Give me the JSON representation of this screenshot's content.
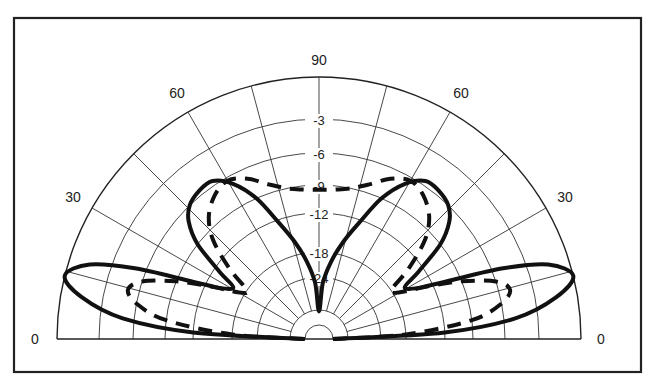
{
  "chart_data": {
    "type": "polar",
    "title": "",
    "layout": {
      "center": [
        319,
        339
      ],
      "frame": [
        14,
        18,
        641,
        372
      ],
      "grid": true,
      "half_plane": "upper"
    },
    "angle_axis": {
      "unit": "degrees elevation",
      "tick_labels": [
        {
          "text": "0",
          "angle": 0,
          "side": "right"
        },
        {
          "text": "30",
          "angle": 30,
          "side": "right"
        },
        {
          "text": "60",
          "angle": 60,
          "side": "right"
        },
        {
          "text": "90",
          "angle": 90,
          "side": "top"
        },
        {
          "text": "60",
          "angle": 120,
          "side": "left"
        },
        {
          "text": "30",
          "angle": 150,
          "side": "left"
        },
        {
          "text": "0",
          "angle": 180,
          "side": "left"
        }
      ],
      "spokes_deg": [
        15,
        30,
        45,
        60,
        75,
        90,
        105,
        120,
        135,
        150,
        165
      ]
    },
    "radial_axis": {
      "unit": "dB",
      "rings": [
        {
          "db": 0,
          "r": 262,
          "label": ""
        },
        {
          "db": -3,
          "r": 220,
          "label": "-3"
        },
        {
          "db": -6,
          "r": 186,
          "label": "-6"
        },
        {
          "db": -9,
          "r": 154,
          "label": "-9"
        },
        {
          "db": -12,
          "r": 126,
          "label": "-12"
        },
        {
          "db": -18,
          "r": 87,
          "label": "-18"
        },
        {
          "db": -24,
          "r": 62,
          "label": "-24"
        },
        {
          "db": -30,
          "r": 29,
          "label": ""
        },
        {
          "db": -40,
          "r": 14,
          "label": ""
        }
      ]
    },
    "series": [
      {
        "name": "Pattern A (solid)",
        "style": "solid",
        "points": [
          [
            0,
            -40
          ],
          [
            3,
            -12
          ],
          [
            6,
            -5
          ],
          [
            10,
            -1.5
          ],
          [
            14,
            0
          ],
          [
            18,
            -1.5
          ],
          [
            21,
            -5
          ],
          [
            24,
            -10
          ],
          [
            27,
            -14
          ],
          [
            31,
            -16
          ],
          [
            34,
            -13
          ],
          [
            38,
            -9
          ],
          [
            42,
            -7
          ],
          [
            46,
            -6
          ],
          [
            51,
            -5.6
          ],
          [
            56,
            -5.6
          ],
          [
            61,
            -6.8
          ],
          [
            66,
            -9
          ],
          [
            71,
            -12.5
          ],
          [
            76,
            -16
          ],
          [
            81,
            -20
          ],
          [
            86,
            -25
          ],
          [
            90,
            -31
          ],
          [
            94,
            -25
          ],
          [
            99,
            -20
          ],
          [
            104,
            -16
          ],
          [
            109,
            -12.5
          ],
          [
            114,
            -9
          ],
          [
            119,
            -6.8
          ],
          [
            124,
            -5.6
          ],
          [
            129,
            -5.6
          ],
          [
            134,
            -6
          ],
          [
            138,
            -7
          ],
          [
            142,
            -9
          ],
          [
            146,
            -13
          ],
          [
            149,
            -16
          ],
          [
            153,
            -14
          ],
          [
            156,
            -10
          ],
          [
            159,
            -5
          ],
          [
            162,
            -1.5
          ],
          [
            166,
            0
          ],
          [
            170,
            -1.5
          ],
          [
            174,
            -5
          ],
          [
            177,
            -12
          ],
          [
            180,
            -40
          ]
        ]
      },
      {
        "name": "Pattern B (dashed)",
        "style": "dashed",
        "points": [
          [
            0,
            -40
          ],
          [
            3,
            -18
          ],
          [
            7,
            -9
          ],
          [
            11,
            -6
          ],
          [
            14.5,
            -5
          ],
          [
            18,
            -6
          ],
          [
            22,
            -9
          ],
          [
            26,
            -13
          ],
          [
            30,
            -17
          ],
          [
            34,
            -18
          ],
          [
            38,
            -14
          ],
          [
            43,
            -10
          ],
          [
            48,
            -8
          ],
          [
            54,
            -6.8
          ],
          [
            60,
            -6.3
          ],
          [
            66,
            -7
          ],
          [
            72,
            -8.2
          ],
          [
            78,
            -9
          ],
          [
            84,
            -9.4
          ],
          [
            90,
            -9.5
          ],
          [
            96,
            -9.4
          ],
          [
            102,
            -9
          ],
          [
            108,
            -8.2
          ],
          [
            114,
            -7
          ],
          [
            120,
            -6.3
          ],
          [
            126,
            -6.8
          ],
          [
            132,
            -8
          ],
          [
            137,
            -10
          ],
          [
            142,
            -14
          ],
          [
            146,
            -18
          ],
          [
            150,
            -17
          ],
          [
            154,
            -13
          ],
          [
            158,
            -9
          ],
          [
            162,
            -6
          ],
          [
            165.5,
            -5
          ],
          [
            169,
            -6
          ],
          [
            173,
            -9
          ],
          [
            177,
            -18
          ],
          [
            180,
            -40
          ]
        ]
      }
    ]
  }
}
